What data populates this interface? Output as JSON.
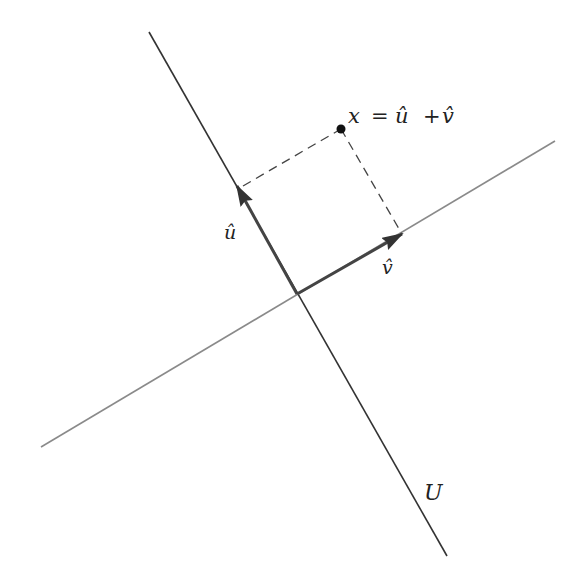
{
  "diagram": {
    "lines": {
      "U": {
        "label": "U",
        "x1": 149,
        "y1": 32,
        "x2": 447,
        "y2": 556,
        "color": "#333333"
      },
      "U_perp": {
        "x1": 41,
        "y1": 447,
        "x2": 555,
        "y2": 141,
        "color": "#888888"
      }
    },
    "origin": {
      "x": 297,
      "y": 294
    },
    "vectors": {
      "u_hat": {
        "label": "û",
        "tip_x": 237,
        "tip_y": 186,
        "color": "#444444"
      },
      "v_hat": {
        "label": "v̂",
        "tip_x": 402,
        "tip_y": 234,
        "color": "#444444"
      }
    },
    "point": {
      "label": "x",
      "x": 341,
      "y": 129
    },
    "equation": {
      "lhs": "x",
      "eq": "=",
      "term1": "û",
      "plus": "+",
      "term2": "v̂"
    },
    "labels": {
      "u_hat": "û",
      "v_hat": "v̂",
      "U": "U"
    }
  }
}
